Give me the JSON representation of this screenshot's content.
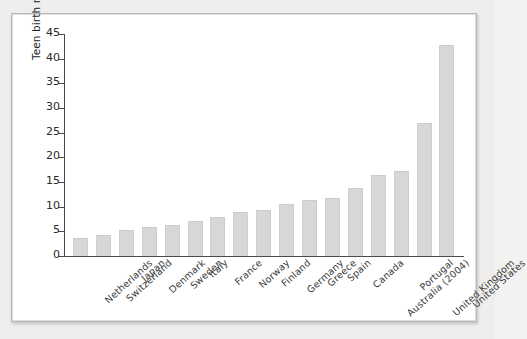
{
  "chart_data": {
    "type": "bar",
    "title": "",
    "subtitle": "",
    "xlabel": "",
    "ylabel": "Teen birth rate (per 1,000 girls 15–19)",
    "ylim": [
      0,
      45
    ],
    "yticks": [
      0,
      5,
      10,
      15,
      20,
      25,
      30,
      35,
      40,
      45
    ],
    "grid": false,
    "legend": "none",
    "bar_color": "#d7d7d7",
    "axis_color": "#4b4b4b",
    "background_color": "#ffffff",
    "categories": [
      "Netherlands",
      "Switzerland",
      "Japan",
      "Denmark",
      "Sweden",
      "Italy",
      "France",
      "Norway",
      "Finland",
      "Germany",
      "Greece",
      "Spain",
      "Canada",
      "Australia (2004)",
      "Portugal",
      "United Kingdom",
      "United States"
    ],
    "values": [
      3.7,
      4.3,
      5.2,
      5.9,
      6.3,
      7.1,
      8.0,
      9.0,
      9.4,
      10.5,
      11.4,
      11.7,
      13.7,
      16.4,
      17.3,
      27.0,
      42.7
    ]
  }
}
